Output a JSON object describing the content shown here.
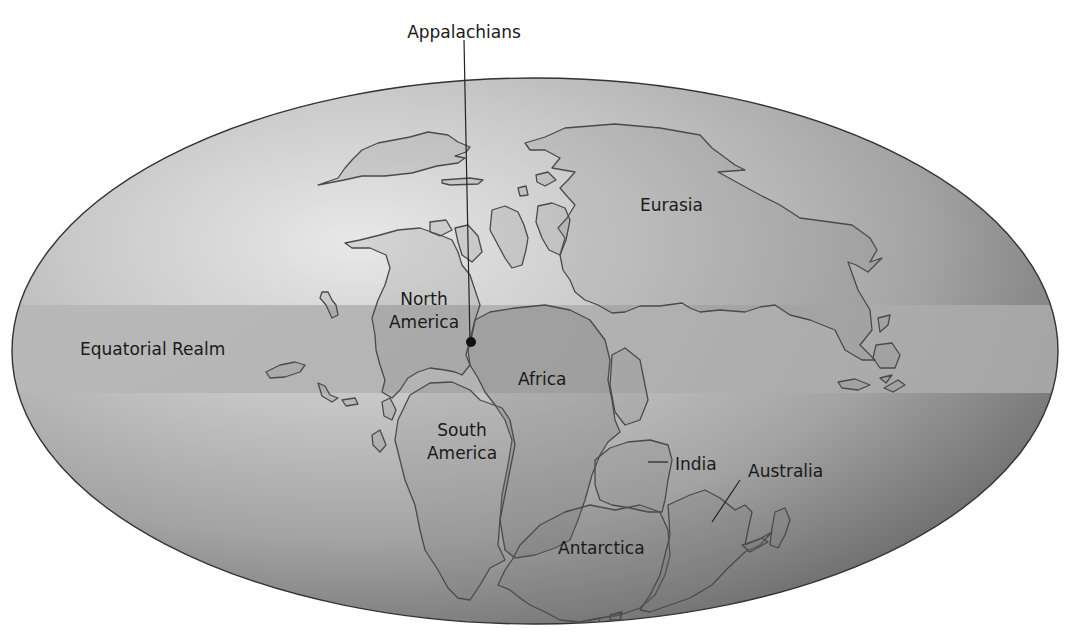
{
  "map": {
    "title": "Pangaea (Late Paleozoic supercontinent)",
    "projection": "elliptical (Mollweide-style) world projection",
    "colors": {
      "background": "#ffffff",
      "globe_highlight": "#e6e6e6",
      "globe_mid": "#b4b4b4",
      "globe_edge": "#6e6e6e",
      "equatorial_band": "#b3b3b3",
      "land_outline": "#4a4a4a",
      "text": "#1a1a1a"
    },
    "callout": {
      "label": "Appalachians",
      "marker": "dot"
    },
    "band": {
      "label": "Equatorial Realm"
    },
    "continents": {
      "north_america_line1": "North",
      "north_america_line2": "America",
      "south_america_line1": "South",
      "south_america_line2": "America",
      "eurasia": "Eurasia",
      "africa": "Africa",
      "india": "India",
      "australia": "Australia",
      "antarctica": "Antarctica"
    },
    "icons": {
      "appalachians_marker": "filled-circle-dot"
    }
  }
}
